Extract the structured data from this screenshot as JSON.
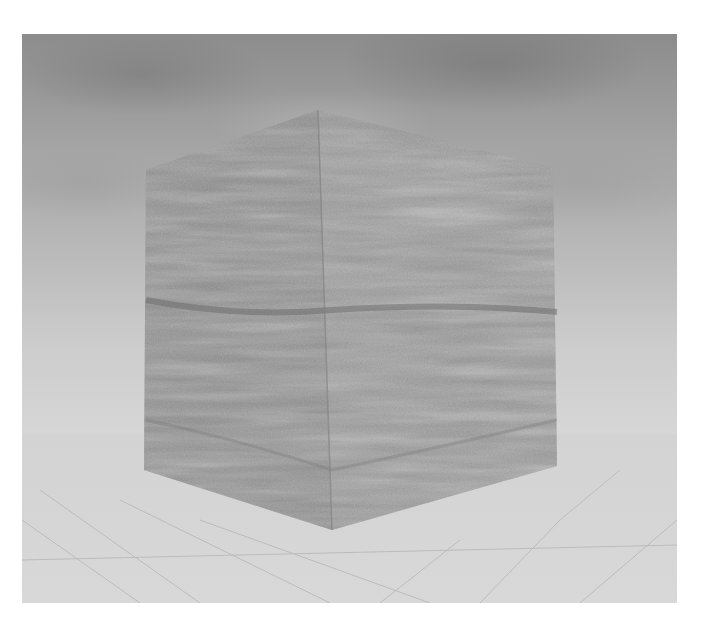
{
  "scene": {
    "description": "Rendered 3D scene of a wood-textured cube over a gridded floor with a cloudy sky background",
    "object": "wooden-cube",
    "background": "cloudy-skybox",
    "floor": "grid-plane",
    "colors": {
      "sky_top": "#8c8c8c",
      "sky_horizon": "#d6d6d6",
      "cube_left_face": "#8f8f8f",
      "cube_right_face": "#9a9a9a",
      "grain_dark": "#6e6e6e",
      "floor_line": "#b8b8b8"
    },
    "cube_vertices_px": {
      "top_left": [
        146,
        170
      ],
      "top_center": [
        318,
        110
      ],
      "top_right": [
        553,
        168
      ],
      "bottom_left": [
        144,
        470
      ],
      "bottom_center": [
        332,
        530
      ],
      "bottom_right": [
        557,
        466
      ]
    }
  },
  "caption": {
    "text": ""
  }
}
